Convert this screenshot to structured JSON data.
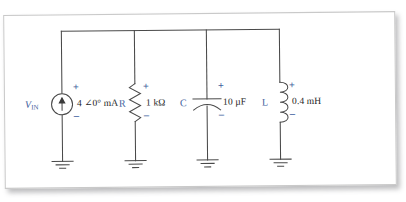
{
  "figure": {
    "type": "circuit-schematic",
    "background_color": "#ffffff",
    "page_color": "#ffffff",
    "wire_color": "#4a4a4a",
    "label_color": "#1d1d1d",
    "reference_designator_color": "#3f5f9e",
    "polarity_color": "#3f5f9e"
  },
  "branches": [
    {
      "designator": "V",
      "designator_subscript": "IN",
      "symbol": "current-source",
      "value": "4 ∠0° mA",
      "polarity_plus": "+",
      "polarity_minus": "−",
      "ground": "earth-ground"
    },
    {
      "designator": "R",
      "designator_subscript": "",
      "symbol": "resistor",
      "value": "1 kΩ",
      "polarity_plus": "+",
      "polarity_minus": "−",
      "ground": "earth-ground"
    },
    {
      "designator": "C",
      "designator_subscript": "",
      "symbol": "capacitor",
      "value": "10 µF",
      "polarity_plus": "+",
      "polarity_minus": "−",
      "ground": "earth-ground"
    },
    {
      "designator": "L",
      "designator_subscript": "",
      "symbol": "inductor",
      "value": "0.4 mH",
      "polarity_plus": "+",
      "polarity_minus": "−",
      "ground": "earth-ground"
    }
  ]
}
